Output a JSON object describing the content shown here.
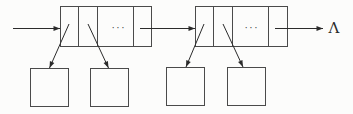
{
  "diagram": {
    "type": "linked-list",
    "background": "#fcfcfb",
    "line_color": "#2b2b2b",
    "box_stroke": "#4a4a4a",
    "null_label": "Λ",
    "null_label_pos": {
      "x": 334,
      "y": 33
    },
    "nodes": [
      {
        "name": "list-node-1",
        "x": 60.5,
        "y": 6.5,
        "width": 91,
        "height": 40,
        "dividers": [
          78.5,
          97.5,
          133.5
        ],
        "dots_label": "···",
        "dots_pos": {
          "x": 119,
          "y": 30.5
        }
      },
      {
        "name": "list-node-2",
        "x": 195.5,
        "y": 6.5,
        "width": 92,
        "height": 40,
        "dividers": [
          213.5,
          232.5,
          268.5
        ],
        "dots_label": "···",
        "dots_pos": {
          "x": 252,
          "y": 30.5
        }
      }
    ],
    "squares": [
      {
        "name": "child-square-1",
        "x": 30.5,
        "y": 68.5,
        "width": 38,
        "height": 38
      },
      {
        "name": "child-square-2",
        "x": 90.5,
        "y": 68.5,
        "width": 38,
        "height": 38
      },
      {
        "name": "child-square-3",
        "x": 166.5,
        "y": 67.5,
        "width": 38,
        "height": 38
      },
      {
        "name": "child-square-4",
        "x": 227.5,
        "y": 67.5,
        "width": 38,
        "height": 38
      }
    ],
    "arrows": [
      {
        "name": "entry-pointer-arrow",
        "x1": 13,
        "y1": 28.5,
        "x2": 60,
        "y2": 28.5
      },
      {
        "name": "next-pointer-arrow",
        "x1": 140,
        "y1": 28.5,
        "x2": 195,
        "y2": 28.5
      },
      {
        "name": "null-pointer-arrow",
        "x1": 275,
        "y1": 28.5,
        "x2": 323,
        "y2": 28.5
      },
      {
        "name": "child-pointer-arrow-1",
        "x1": 69,
        "y1": 24,
        "x2": 49.5,
        "y2": 68
      },
      {
        "name": "child-pointer-arrow-2",
        "x1": 88,
        "y1": 24,
        "x2": 108.5,
        "y2": 68
      },
      {
        "name": "child-pointer-arrow-3",
        "x1": 204,
        "y1": 24,
        "x2": 186,
        "y2": 67
      },
      {
        "name": "child-pointer-arrow-4",
        "x1": 223,
        "y1": 24,
        "x2": 243,
        "y2": 67
      }
    ]
  }
}
